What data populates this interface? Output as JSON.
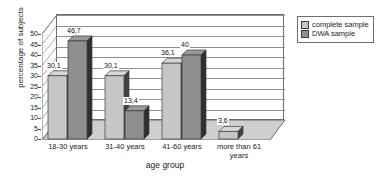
{
  "chart_data": {
    "type": "bar",
    "title": "",
    "xlabel": "age group",
    "ylabel": "percentage of subjects",
    "categories": [
      "18-30 years",
      "31-40 years",
      "41-60 years",
      "more than 61 years"
    ],
    "series": [
      {
        "name": "complete sample",
        "color": "#c6c6c6",
        "values": [
          30.1,
          30.1,
          36.1,
          3.6
        ],
        "labels": [
          "30,1",
          "30,1",
          "36,1",
          "3,6"
        ]
      },
      {
        "name": "DWA sample",
        "color": "#8f8f8f",
        "values": [
          46.7,
          13.4,
          40,
          0
        ],
        "labels": [
          "46,7",
          "13,4",
          "40",
          ""
        ]
      }
    ],
    "ylim": [
      0,
      50
    ],
    "yticks": [
      0,
      5,
      10,
      15,
      20,
      25,
      30,
      35,
      40,
      45,
      50
    ],
    "ytick_labels": [
      "0",
      "5",
      "10",
      "15",
      "20",
      "25",
      "30",
      "35",
      "40",
      "45",
      "50"
    ],
    "grid": true,
    "legend_position": "right",
    "style": "3d-column"
  },
  "legend": {
    "items": [
      {
        "label": "complete sample",
        "swatch": "#c6c6c6"
      },
      {
        "label": "DWA sample",
        "swatch": "#8f8f8f"
      }
    ]
  }
}
